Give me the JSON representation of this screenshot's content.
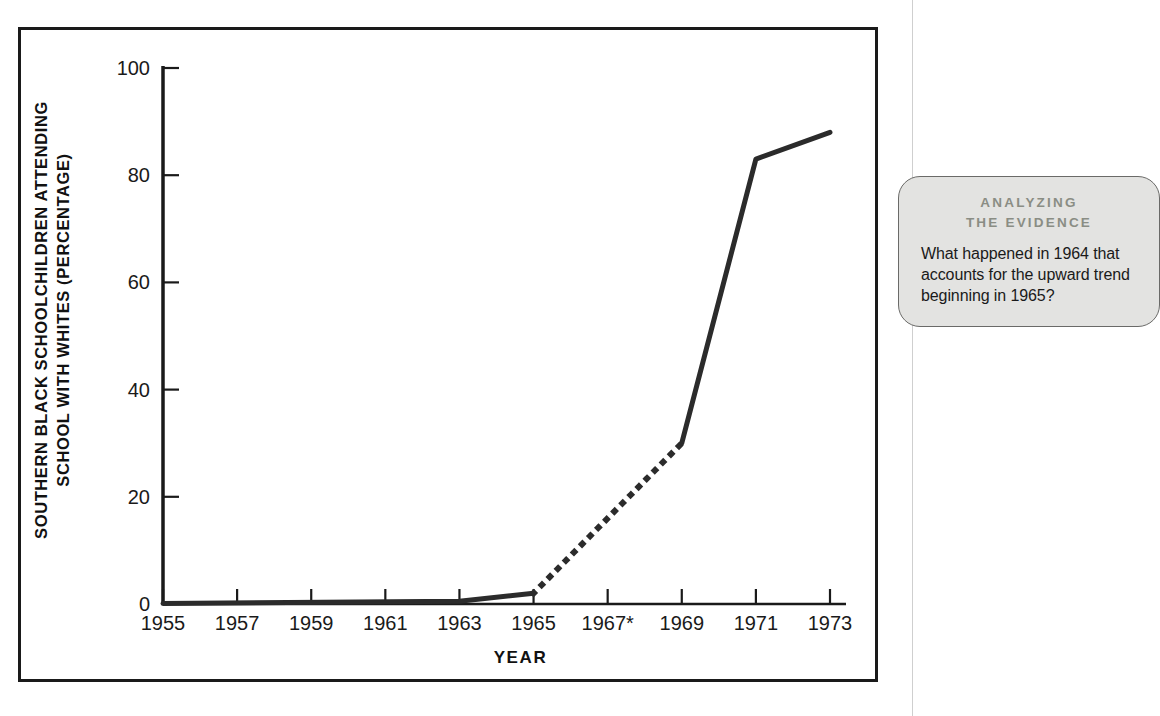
{
  "figure": {
    "y_axis_title": "SOUTHERN BLACK SCHOOLCHILDREN ATTENDING\nSCHOOL WITH WHITES (PERCENTAGE)",
    "x_axis_title": "YEAR"
  },
  "callout": {
    "heading": "ANALYZING\nTHE EVIDENCE",
    "body": "What happened in 1964 that accounts for the upward trend beginning in 1965?",
    "background_color": "#e3e3e1",
    "heading_color": "#8a8d84",
    "border_color": "#6a6a68"
  },
  "chart_data": {
    "type": "line",
    "title": "",
    "xlabel": "YEAR",
    "ylabel": "SOUTHERN BLACK SCHOOLCHILDREN ATTENDING SCHOOL WITH WHITES (PERCENTAGE)",
    "xlim": [
      1955,
      1973
    ],
    "ylim": [
      0,
      100
    ],
    "grid": false,
    "legend": "none",
    "line_color": "#2b2b2b",
    "x_tick_labels": [
      "1955",
      "1957",
      "1959",
      "1961",
      "1963",
      "1965",
      "1967*",
      "1969",
      "1971",
      "1973"
    ],
    "x_tick_values": [
      1955,
      1957,
      1959,
      1961,
      1963,
      1965,
      1967,
      1969,
      1971,
      1973
    ],
    "y_tick_labels": [
      "0",
      "20",
      "40",
      "60",
      "80",
      "100"
    ],
    "y_tick_values": [
      0,
      20,
      40,
      60,
      80,
      100
    ],
    "x": [
      1955,
      1963,
      1965,
      1969,
      1971,
      1973
    ],
    "values": [
      0.1,
      0.5,
      2.0,
      30.0,
      83.0,
      88.0
    ],
    "series": [
      {
        "name": "Southern black schoolchildren attending school with whites",
        "style": "solid",
        "x": [
          1955,
          1963,
          1965
        ],
        "values": [
          0.1,
          0.5,
          2.0
        ]
      },
      {
        "name": "Interpolated (no data 1966-1968)",
        "style": "dotted",
        "x": [
          1965,
          1969
        ],
        "values": [
          2.0,
          30.0
        ]
      },
      {
        "name": "Southern black schoolchildren attending school with whites",
        "style": "solid",
        "x": [
          1969,
          1971,
          1973
        ],
        "values": [
          30.0,
          83.0,
          88.0
        ]
      }
    ],
    "annotations": [
      {
        "text": "*",
        "note": "asterisk on 1967 tick label"
      }
    ]
  }
}
